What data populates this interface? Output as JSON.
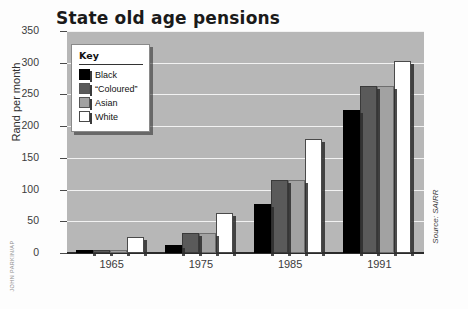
{
  "chart_data": {
    "type": "bar",
    "title": "State old age pensions",
    "xlabel": "",
    "ylabel": "Rand per month",
    "categories": [
      "1965",
      "1975",
      "1985",
      "1991"
    ],
    "series": [
      {
        "name": "Black",
        "color": "#000000",
        "values": [
          4,
          13,
          78,
          225
        ]
      },
      {
        "name": "“Coloured”",
        "color": "#5a5a5a",
        "values": [
          4,
          31,
          115,
          263
        ]
      },
      {
        "name": "Asian",
        "color": "#a2a2a2",
        "values": [
          4,
          31,
          115,
          263
        ]
      },
      {
        "name": "White",
        "color": "#ffffff",
        "values": [
          25,
          63,
          180,
          302
        ]
      }
    ],
    "ylim": [
      0,
      350
    ],
    "yticks": [
      0,
      50,
      100,
      150,
      200,
      250,
      300,
      350
    ],
    "grid": true,
    "legend_position": "inside-top-left",
    "legend_title": "Key",
    "source_note": "Source: SAIRR",
    "photo_credit": "JOHN PARKIN/AP",
    "plot_background": "#b7b7b7",
    "gridline_color": "#f2f2f2"
  }
}
